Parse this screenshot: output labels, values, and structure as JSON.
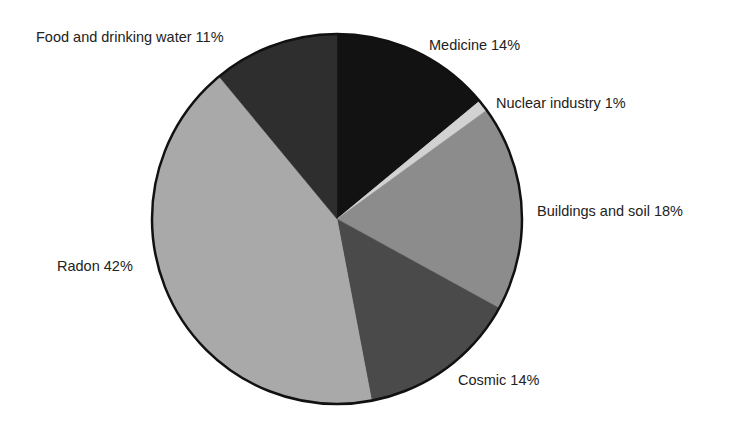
{
  "chart_data": {
    "type": "pie",
    "title": "",
    "start_angle_deg": 0,
    "direction": "clockwise",
    "center": [
      337,
      219
    ],
    "radius": 185,
    "outline_color": "#111111",
    "label_color": "#222222",
    "categories": [
      "Medicine",
      "Nuclear industry",
      "Buildings and soil",
      "Cosmic",
      "Radon",
      "Food and drinking water"
    ],
    "values": [
      14,
      1,
      18,
      14,
      42,
      11
    ],
    "unit": "%",
    "slices": [
      {
        "label": "Medicine",
        "value": 14,
        "text": "Medicine 14%",
        "color": "#121212",
        "label_pos": [
          429,
          45
        ]
      },
      {
        "label": "Nuclear industry",
        "value": 1,
        "text": "Nuclear industry 1%",
        "color": "#d2d2d2",
        "label_pos": [
          496,
          103
        ]
      },
      {
        "label": "Buildings and soil",
        "value": 18,
        "text": "Buildings and soil 18%",
        "color": "#8c8c8c",
        "label_pos": [
          537,
          211
        ]
      },
      {
        "label": "Cosmic",
        "value": 14,
        "text": "Cosmic 14%",
        "color": "#4a4a4a",
        "label_pos": [
          458,
          380
        ]
      },
      {
        "label": "Radon",
        "value": 42,
        "text": "Radon 42%",
        "color": "#a9a9a9",
        "label_pos": [
          57,
          266
        ]
      },
      {
        "label": "Food and drinking water",
        "value": 11,
        "text": "Food and drinking water 11%",
        "color": "#2e2e2e",
        "label_pos": [
          36,
          37
        ]
      }
    ],
    "legend": "none (direct labels)",
    "grid": false
  }
}
